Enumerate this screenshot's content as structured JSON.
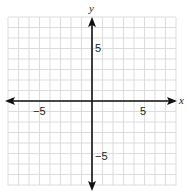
{
  "chart_data": {
    "type": "coordinate-grid",
    "title": "",
    "xlabel": "x",
    "ylabel": "y",
    "xlim": [
      -8,
      8
    ],
    "ylim": [
      -8,
      8
    ],
    "grid": true,
    "grid_step": 1,
    "x_ticks_labeled": [
      -5,
      5
    ],
    "y_ticks_labeled": [
      5,
      -5
    ],
    "x_tick_labels": [
      "−5",
      "5"
    ],
    "y_tick_labels": [
      "5",
      "−5"
    ],
    "series": []
  },
  "colors": {
    "grid": "#d4d4d4",
    "axis": "#111111",
    "background": "#ffffff"
  }
}
